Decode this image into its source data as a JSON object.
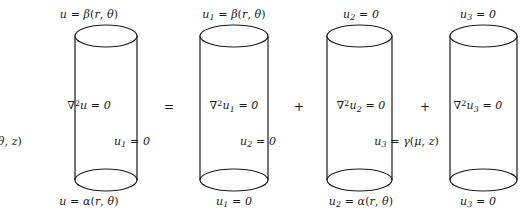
{
  "figure": {
    "stroke_color": "#1a1a1a",
    "background_color": "#ffffff"
  },
  "operators": [
    {
      "symbol": "=",
      "name": "equals-sign",
      "x": 162
    },
    {
      "symbol": "+",
      "name": "plus-sign-1",
      "x": 292
    },
    {
      "symbol": "+",
      "name": "plus-sign-2",
      "x": 418
    }
  ],
  "cylinders": [
    {
      "id": "cylinder-u",
      "x": 28,
      "width": 122,
      "body_left": 75,
      "body_right": 137,
      "top_label": "u = β(r, θ)",
      "center_label": "∇²u = 0",
      "side_label": "u = γ(θ, z)",
      "side_label_right": 128,
      "bottom_label": "u = α(r, θ)"
    },
    {
      "id": "cylinder-u1",
      "x": 172,
      "width": 124,
      "body_left": 200,
      "body_right": 268,
      "top_label": "u₁ = β(r, θ)",
      "center_label": "∇²u₁ = 0",
      "side_label": "u₁ = 0",
      "side_label_right": 146,
      "bottom_label": "u₁ = 0"
    },
    {
      "id": "cylinder-u2",
      "x": 300,
      "width": 122,
      "body_left": 327,
      "body_right": 392,
      "top_label": "u₂ = 0",
      "center_label": "∇²u₂ = 0",
      "side_label": "u₂ = 0",
      "side_label_right": 146,
      "bottom_label": "u₂ = α(r, θ)"
    },
    {
      "id": "cylinder-u3",
      "x": 424,
      "width": 108,
      "body_left": 450,
      "body_right": 517,
      "top_label": "u₃ = 0",
      "center_label": "∇²u₃ = 0",
      "side_label": "u₃ = γ(μ, z)",
      "side_label_right": 93,
      "bottom_label": "u₃ = 0"
    }
  ],
  "geometry": {
    "top_ellipse_cy": 36,
    "bottom_ellipse_cy": 180,
    "ellipse_ry": 11
  }
}
